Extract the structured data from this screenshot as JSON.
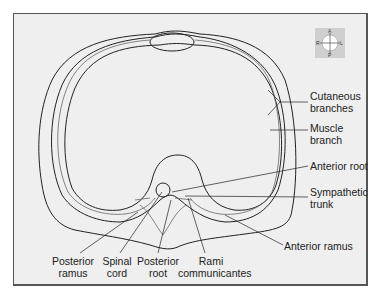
{
  "figure": {
    "orientation_compass": {
      "top": "A",
      "bottom": "P",
      "left": "R",
      "right": "L"
    },
    "labels": {
      "cutaneous_branches": [
        "Cutaneous",
        "branches"
      ],
      "muscle_branch": [
        "Muscle",
        "branch"
      ],
      "anterior_root": "Anterior root",
      "sympathetic_trunk": [
        "Sympathetic",
        "trunk"
      ],
      "anterior_ramus": "Anterior ramus",
      "posterior_ramus": [
        "Posterior",
        "ramus"
      ],
      "spinal_cord": [
        "Spinal",
        "cord"
      ],
      "posterior_root": [
        "Posterior",
        "root"
      ],
      "rami_communicantes": [
        "Rami",
        "communicantes"
      ]
    },
    "colors": {
      "background": "#efefef",
      "frame": "#555555",
      "outline": "#222222",
      "nerve": "#666666",
      "compass_bg": "#cfcfcf"
    }
  }
}
